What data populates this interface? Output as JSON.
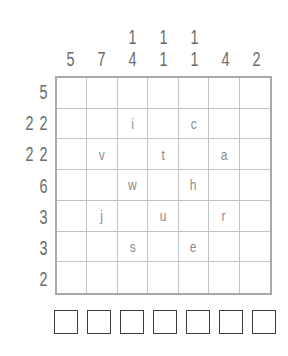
{
  "puzzle": {
    "column_clues": [
      [
        "5"
      ],
      [
        "7"
      ],
      [
        "1",
        "4"
      ],
      [
        "1",
        "1"
      ],
      [
        "1",
        "1"
      ],
      [
        "4"
      ],
      [
        "2"
      ]
    ],
    "row_clues": [
      [
        "5"
      ],
      [
        "2",
        "2"
      ],
      [
        "2",
        "2"
      ],
      [
        "6"
      ],
      [
        "3"
      ],
      [
        "3"
      ],
      [
        "2"
      ]
    ],
    "grid": [
      [
        "",
        "",
        "",
        "",
        "",
        "",
        ""
      ],
      [
        "",
        "",
        "i",
        "",
        "c",
        "",
        ""
      ],
      [
        "",
        "v",
        "",
        "t",
        "",
        "a",
        ""
      ],
      [
        "",
        "",
        "w",
        "",
        "h",
        "",
        ""
      ],
      [
        "",
        "j",
        "",
        "u",
        "",
        "r",
        ""
      ],
      [
        "",
        "",
        "s",
        "",
        "e",
        "",
        ""
      ],
      [
        "",
        "",
        "",
        "",
        "",
        "",
        ""
      ]
    ],
    "answer_boxes": [
      "",
      "",
      "",
      "",
      "",
      "",
      ""
    ]
  }
}
